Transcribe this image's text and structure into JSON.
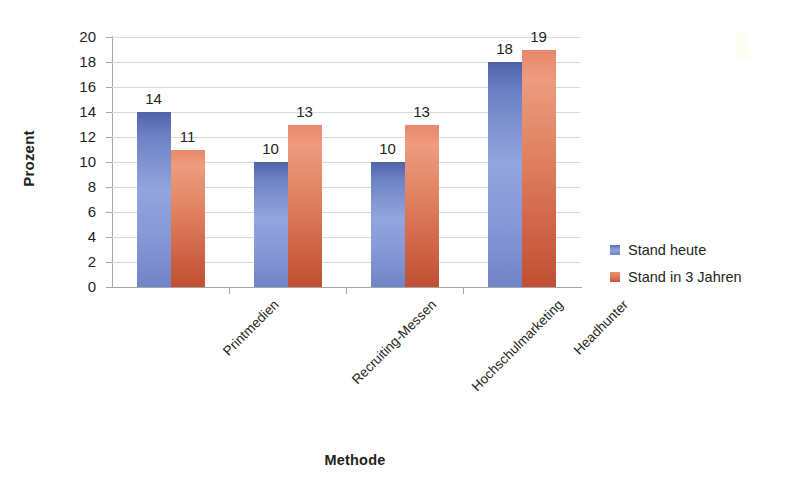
{
  "chart_data": {
    "type": "bar",
    "title": "",
    "xlabel": "Methode",
    "ylabel": "Prozent",
    "categories": [
      "Printmedien",
      "Recruiting-Messen",
      "Hochschulmarketing",
      "Headhunter"
    ],
    "series": [
      {
        "name": "Stand heute",
        "color": "#7184c6",
        "values": [
          14,
          10,
          10,
          18
        ]
      },
      {
        "name": "Stand in 3 Jahren",
        "color": "#d2674a",
        "values": [
          11,
          13,
          13,
          19
        ]
      }
    ],
    "ylim": [
      0,
      20
    ],
    "ytick_step": 2,
    "yticks": [
      20,
      18,
      16,
      14,
      12,
      10,
      8,
      6,
      4,
      2,
      0
    ],
    "grid": "horizontal",
    "legend_position": "right",
    "value_labels": true,
    "xtick_label_rotation": -45
  },
  "axes": {
    "y_title": "Prozent",
    "x_title": "Methode"
  },
  "legend": {
    "items": [
      {
        "label": "Stand heute",
        "swatch": "blue"
      },
      {
        "label": "Stand in 3 Jahren",
        "swatch": "orange"
      }
    ]
  },
  "colors": {
    "blue_top": "#4f63a8",
    "blue_mid": "#93a5dd",
    "blue_bottom": "#7184c6",
    "orange_top": "#e8876c",
    "orange_mid": "#e08463",
    "orange_bottom": "#c04f33",
    "gridline": "#d9d9d9",
    "axis": "#a6a6a6",
    "text": "#231f20",
    "background": "#ffffff"
  }
}
